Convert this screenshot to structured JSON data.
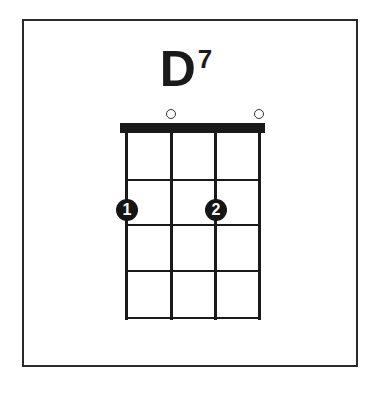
{
  "chord": {
    "name": "D",
    "superscript": "7"
  },
  "diagram": {
    "strings": 4,
    "frets": 4,
    "open_strings": [
      2,
      4
    ],
    "fingers": [
      {
        "string": 1,
        "fret": 2,
        "label": "1"
      },
      {
        "string": 3,
        "fret": 2,
        "label": "2"
      }
    ],
    "open_marker": "o"
  }
}
